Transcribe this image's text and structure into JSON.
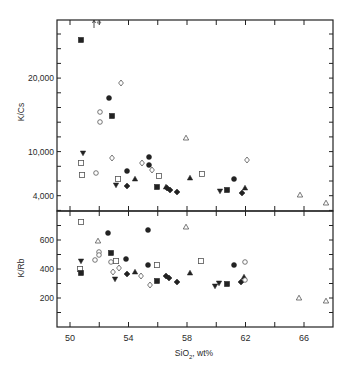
{
  "chart_data": [
    {
      "type": "scatter",
      "title": "",
      "xlabel": "SiO2, wt%",
      "ylabel": "K/Cs",
      "xlim": [
        49.1,
        68
      ],
      "ytick_labels": [
        "4,000",
        "10,000",
        "20,000"
      ],
      "grid": false,
      "legend": null,
      "annotation": "arrow at SiO2≈52.4 pointing up (off-scale open triangle)",
      "series": [
        {
          "name": "filled-square",
          "points": [
            [
              50.9,
              26000
            ],
            [
              53.1,
              14000
            ],
            [
              55.3,
              11000
            ],
            [
              55.9,
              4700
            ],
            [
              60.0,
              4700
            ]
          ]
        },
        {
          "name": "open-circle",
          "points": [
            [
              52.0,
              12000
            ],
            [
              52.0,
              10800
            ],
            [
              51.7,
              6800
            ],
            [
              53.0,
              14900
            ],
            [
              57.4,
              10700
            ]
          ]
        },
        {
          "name": "filled-circle",
          "points": [
            [
              52.8,
              16000
            ],
            [
              55.3,
              9300
            ],
            [
              54.0,
              5200
            ],
            [
              57.3,
              5700
            ],
            [
              57.6,
              8600
            ],
            [
              61.4,
              5800
            ]
          ]
        },
        {
          "name": "filled-diamond",
          "points": [
            [
              53.0,
              4600
            ],
            [
              54.1,
              4700
            ],
            [
              57.2,
              4300
            ],
            [
              57.7,
              4000
            ],
            [
              61.1,
              4200
            ],
            [
              61.6,
              4500
            ]
          ]
        },
        {
          "name": "open-diamond",
          "points": [
            [
              53.6,
              17500
            ],
            [
              52.9,
              8200
            ],
            [
              56.1,
              7800
            ],
            [
              56.5,
              7200
            ],
            [
              62.0,
              7900
            ]
          ]
        },
        {
          "name": "open-square",
          "points": [
            [
              50.4,
              7600
            ],
            [
              50.5,
              6900
            ],
            [
              53.6,
              5900
            ],
            [
              55.2,
              6200
            ],
            [
              59.3,
              6200
            ],
            [
              56.6,
              6000
            ]
          ]
        },
        {
          "name": "filled-triangle-down",
          "points": [
            [
              50.9,
              9500
            ],
            [
              53.9,
              5100
            ],
            [
              60.2,
              4800
            ]
          ]
        },
        {
          "name": "filled-triangle-up",
          "points": [
            [
              54.5,
              5300
            ],
            [
              56.4,
              5300
            ],
            [
              58.7,
              5800
            ],
            [
              62.1,
              4800
            ],
            [
              61.9,
              5000
            ]
          ]
        },
        {
          "name": "open-triangle",
          "points": [
            [
              57.9,
              11500
            ],
            [
              65.6,
              3900
            ],
            [
              67.3,
              3500
            ]
          ]
        }
      ]
    },
    {
      "type": "scatter",
      "title": "",
      "xlabel": "SiO2, wt%",
      "ylabel": "K/Rb",
      "xlim": [
        49.1,
        68
      ],
      "ylim": [
        100,
        800
      ],
      "ytick_labels": [
        "200",
        "400",
        "600"
      ],
      "xtick_labels": [
        "50",
        "54",
        "58",
        "62",
        "66"
      ],
      "grid": false,
      "legend": null,
      "series": [
        {
          "name": "filled-square",
          "points": [
            [
              50.8,
              370
            ],
            [
              52.8,
              500
            ],
            [
              55.9,
              320
            ],
            [
              60.7,
              300
            ]
          ]
        },
        {
          "name": "open-square",
          "points": [
            [
              50.8,
              720
            ],
            [
              50.7,
              400
            ],
            [
              53.2,
              450
            ],
            [
              56.0,
              430
            ],
            [
              59.0,
              450
            ]
          ]
        },
        {
          "name": "filled-circle",
          "points": [
            [
              52.5,
              650
            ],
            [
              55.3,
              670
            ],
            [
              53.8,
              475
            ],
            [
              55.3,
              430
            ],
            [
              61.3,
              430
            ]
          ]
        },
        {
          "name": "open-circle",
          "points": [
            [
              51.7,
              465
            ],
            [
              52.2,
              520
            ],
            [
              52.8,
              440
            ],
            [
              62.0,
              450
            ]
          ]
        },
        {
          "name": "open-diamond",
          "points": [
            [
              52.3,
              500
            ],
            [
              52.9,
              380
            ],
            [
              53.4,
              410
            ],
            [
              54.8,
              350
            ],
            [
              55.7,
              300
            ]
          ]
        },
        {
          "name": "filled-diamond",
          "points": [
            [
              53.8,
              365
            ],
            [
              56.7,
              345
            ],
            [
              57.3,
              345
            ],
            [
              57.6,
              320
            ],
            [
              61.7,
              325
            ]
          ]
        },
        {
          "name": "filled-triangle-down",
          "points": [
            [
              50.8,
              460
            ],
            [
              53.3,
              330
            ],
            [
              60.0,
              285
            ],
            [
              60.3,
              300
            ]
          ]
        },
        {
          "name": "filled-triangle-up",
          "points": [
            [
              54.4,
              385
            ],
            [
              56.6,
              355
            ],
            [
              58.2,
              375
            ],
            [
              62.0,
              340
            ]
          ]
        },
        {
          "name": "open-triangle",
          "points": [
            [
              51.8,
              600
            ],
            [
              57.9,
              690
            ],
            [
              65.6,
              200
            ],
            [
              67.3,
              185
            ]
          ]
        },
        {
          "name": "open-circle-right",
          "points": [
            [
              62.0,
              310
            ]
          ]
        }
      ]
    }
  ],
  "axes": {
    "x_ticks": [
      {
        "value": 50,
        "label": "50"
      },
      {
        "value": 52,
        "label": ""
      },
      {
        "value": 54,
        "label": "54"
      },
      {
        "value": 56,
        "label": ""
      },
      {
        "value": 58,
        "label": "58"
      },
      {
        "value": 60,
        "label": ""
      },
      {
        "value": 62,
        "label": "62"
      },
      {
        "value": 64,
        "label": ""
      },
      {
        "value": 66,
        "label": "66"
      }
    ],
    "x_label_main": "SiO",
    "x_label_sub": "2",
    "x_label_tail": ", wt%",
    "top_ylabel": "K/Cs",
    "bottom_ylabel": "K/Rb",
    "top_y_labels": [
      {
        "label": "20,000",
        "py": 78
      },
      {
        "label": "10,000",
        "py": 152
      },
      {
        "label": "4,000",
        "py": 196
      }
    ],
    "bottom_y_labels": [
      {
        "label": "600",
        "value": 600
      },
      {
        "label": "400",
        "value": 400
      },
      {
        "label": "200",
        "value": 200
      }
    ]
  },
  "top_points_px": [
    {
      "m": "fsq",
      "x": 81,
      "y": 40
    },
    {
      "m": "oci",
      "x": 100,
      "y": 112
    },
    {
      "m": "oci",
      "x": 100,
      "y": 122
    },
    {
      "m": "fci",
      "x": 109,
      "y": 98
    },
    {
      "m": "fsq",
      "x": 112,
      "y": 116
    },
    {
      "m": "odi",
      "x": 121,
      "y": 83
    },
    {
      "m": "ftd",
      "x": 83,
      "y": 153
    },
    {
      "m": "osq",
      "x": 81,
      "y": 163
    },
    {
      "m": "osq",
      "x": 82,
      "y": 175
    },
    {
      "m": "oci",
      "x": 96,
      "y": 173
    },
    {
      "m": "odi",
      "x": 112,
      "y": 158
    },
    {
      "m": "osq",
      "x": 118,
      "y": 179
    },
    {
      "m": "ftd",
      "x": 116,
      "y": 185
    },
    {
      "m": "fci",
      "x": 127,
      "y": 171
    },
    {
      "m": "fdi",
      "x": 127,
      "y": 186
    },
    {
      "m": "ftu",
      "x": 135,
      "y": 179
    },
    {
      "m": "odi",
      "x": 142,
      "y": 163
    },
    {
      "m": "fci",
      "x": 149,
      "y": 157
    },
    {
      "m": "fci",
      "x": 149,
      "y": 165
    },
    {
      "m": "odi",
      "x": 152,
      "y": 170
    },
    {
      "m": "osq",
      "x": 159,
      "y": 176
    },
    {
      "m": "fsq",
      "x": 157,
      "y": 187
    },
    {
      "m": "fdi",
      "x": 167,
      "y": 188
    },
    {
      "m": "fdi",
      "x": 170,
      "y": 190
    },
    {
      "m": "ftu",
      "x": 166,
      "y": 187
    },
    {
      "m": "fdi",
      "x": 177,
      "y": 192
    },
    {
      "m": "oti",
      "x": 186,
      "y": 138
    },
    {
      "m": "ftu",
      "x": 190,
      "y": 178
    },
    {
      "m": "osq",
      "x": 202,
      "y": 174
    },
    {
      "m": "ftd",
      "x": 220,
      "y": 191
    },
    {
      "m": "fsq",
      "x": 227,
      "y": 190
    },
    {
      "m": "fci",
      "x": 234,
      "y": 179
    },
    {
      "m": "fdi",
      "x": 242,
      "y": 193
    },
    {
      "m": "ftu",
      "x": 245,
      "y": 188
    },
    {
      "m": "odi",
      "x": 247,
      "y": 160
    },
    {
      "m": "oti",
      "x": 300,
      "y": 195
    },
    {
      "m": "oti",
      "x": 326,
      "y": 203
    }
  ],
  "bottom_points_px": [
    {
      "m": "osq",
      "x": 81,
      "y": 222
    },
    {
      "m": "oti",
      "x": 98,
      "y": 241
    },
    {
      "m": "fci",
      "x": 108,
      "y": 233
    },
    {
      "m": "fci",
      "x": 148,
      "y": 230
    },
    {
      "m": "oti",
      "x": 186,
      "y": 227
    },
    {
      "m": "oci",
      "x": 99,
      "y": 252
    },
    {
      "m": "oci",
      "x": 99,
      "y": 255
    },
    {
      "m": "fsq",
      "x": 111,
      "y": 253
    },
    {
      "m": "ftd",
      "x": 81,
      "y": 261
    },
    {
      "m": "oci",
      "x": 95,
      "y": 260
    },
    {
      "m": "oci",
      "x": 111,
      "y": 262
    },
    {
      "m": "osq",
      "x": 116,
      "y": 261
    },
    {
      "m": "odi",
      "x": 119,
      "y": 268
    },
    {
      "m": "odi",
      "x": 113,
      "y": 272
    },
    {
      "m": "fci",
      "x": 126,
      "y": 259
    },
    {
      "m": "osq",
      "x": 80,
      "y": 269
    },
    {
      "m": "fsq",
      "x": 81,
      "y": 273
    },
    {
      "m": "ftd",
      "x": 115,
      "y": 279
    },
    {
      "m": "fdi",
      "x": 127,
      "y": 274
    },
    {
      "m": "ftu",
      "x": 135,
      "y": 272
    },
    {
      "m": "odi",
      "x": 141,
      "y": 276
    },
    {
      "m": "fci",
      "x": 148,
      "y": 265
    },
    {
      "m": "osq",
      "x": 157,
      "y": 265
    },
    {
      "m": "odi",
      "x": 150,
      "y": 285
    },
    {
      "m": "fsq",
      "x": 157,
      "y": 281
    },
    {
      "m": "fdi",
      "x": 166,
      "y": 276
    },
    {
      "m": "fdi",
      "x": 169,
      "y": 278
    },
    {
      "m": "fdi",
      "x": 177,
      "y": 282
    },
    {
      "m": "ftu",
      "x": 190,
      "y": 273
    },
    {
      "m": "osq",
      "x": 201,
      "y": 261
    },
    {
      "m": "ftd",
      "x": 215,
      "y": 286
    },
    {
      "m": "ftd",
      "x": 219,
      "y": 283
    },
    {
      "m": "fsq",
      "x": 227,
      "y": 284
    },
    {
      "m": "fci",
      "x": 234,
      "y": 265
    },
    {
      "m": "fdi",
      "x": 241,
      "y": 282
    },
    {
      "m": "ftu",
      "x": 244,
      "y": 277
    },
    {
      "m": "oci",
      "x": 245,
      "y": 262
    },
    {
      "m": "oci",
      "x": 245,
      "y": 280
    },
    {
      "m": "oti",
      "x": 299,
      "y": 298
    },
    {
      "m": "oti",
      "x": 326,
      "y": 301
    }
  ],
  "colors": {
    "ink": "#222222",
    "background": "#ffffff"
  }
}
